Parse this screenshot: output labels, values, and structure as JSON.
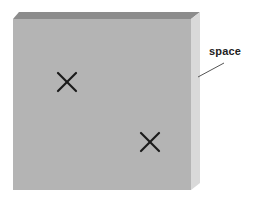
{
  "diagram": {
    "type": "3d-slab-illustration",
    "label": "space",
    "colors": {
      "front_face": "#b4b4b4",
      "top_face": "#8c8c8c",
      "side_face": "#d9d9d9",
      "marker": "#1a1a1a",
      "leader_line": "#555555"
    },
    "markers": [
      {
        "symbol": "X",
        "x": 67,
        "y": 82
      },
      {
        "symbol": "X",
        "x": 150,
        "y": 142
      }
    ]
  }
}
